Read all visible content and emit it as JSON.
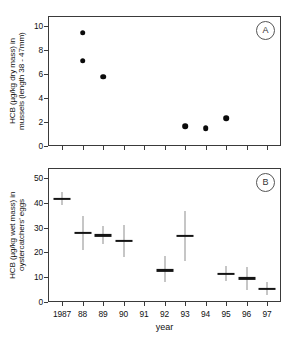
{
  "figure": {
    "xaxis_label": "year",
    "categories": [
      "1987",
      "88",
      "89",
      "90",
      "91",
      "92",
      "93",
      "94",
      "95",
      "96",
      "97"
    ]
  },
  "panelA": {
    "tag": "A",
    "ylabel": "HCB (µg/kg dry mass) in\nmussels (length 38 - 47mm)",
    "yticks": [
      "0",
      "2",
      "4",
      "6",
      "8",
      "10"
    ]
  },
  "panelB": {
    "tag": "B",
    "ylabel": "HCB (µg/kg wet mass) in\noystercatchers' eggs",
    "yticks": [
      "0",
      "10",
      "20",
      "30",
      "40",
      "50"
    ]
  },
  "chart_data": [
    {
      "type": "scatter",
      "panel": "A",
      "title": "",
      "xlabel": "year",
      "ylabel": "HCB (µg/kg dry mass) in mussels (length 38 - 47mm)",
      "x": [
        "1987",
        "88",
        "89",
        "90",
        "91",
        "92",
        "93",
        "94",
        "95",
        "96",
        "97"
      ],
      "xlim": [
        1986.5,
        1997.5
      ],
      "ylim": [
        0,
        10.8
      ],
      "yticks": [
        0,
        2,
        4,
        6,
        8,
        10
      ],
      "grid": false,
      "legend": null,
      "points": [
        {
          "year": "88",
          "value": 9.4
        },
        {
          "year": "88",
          "value": 7.1
        },
        {
          "year": "89",
          "value": 5.75
        },
        {
          "year": "93",
          "value": 1.65
        },
        {
          "year": "94",
          "value": 1.5
        },
        {
          "year": "95",
          "value": 2.3
        }
      ]
    },
    {
      "type": "scatter",
      "panel": "B",
      "title": "",
      "xlabel": "year",
      "ylabel": "HCB (µg/kg wet mass) in oystercatchers' eggs",
      "x": [
        "1987",
        "88",
        "89",
        "90",
        "91",
        "92",
        "93",
        "94",
        "95",
        "96",
        "97"
      ],
      "xlim": [
        1986.5,
        1997.5
      ],
      "ylim": [
        0,
        54
      ],
      "yticks": [
        0,
        10,
        20,
        30,
        40,
        50
      ],
      "grid": false,
      "legend": null,
      "points": [
        {
          "year": "1987",
          "value": 41.5,
          "low": 39.0,
          "high": 44.5
        },
        {
          "year": "88",
          "value": 27.8,
          "low": 21.0,
          "high": 34.5
        },
        {
          "year": "89",
          "value": 26.8,
          "low": 23.5,
          "high": 30.5
        },
        {
          "year": "90",
          "value": 24.7,
          "low": 18.0,
          "high": 31.0
        },
        {
          "year": "92",
          "value": 12.7,
          "low": 8.0,
          "high": 18.5
        },
        {
          "year": "93",
          "value": 26.7,
          "low": 16.5,
          "high": 36.5
        },
        {
          "year": "95",
          "value": 11.2,
          "low": 8.5,
          "high": 14.5
        },
        {
          "year": "96",
          "value": 9.5,
          "low": 5.0,
          "high": 14.0
        },
        {
          "year": "97",
          "value": 5.3,
          "low": 3.0,
          "high": 8.0
        }
      ]
    }
  ]
}
